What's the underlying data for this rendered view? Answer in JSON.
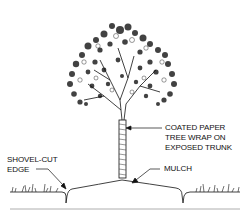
{
  "diagram": {
    "labels": {
      "tree_wrap": {
        "lines": [
          "COATED PAPER",
          "TREE WRAP ON",
          "EXPOSED TRUNK"
        ]
      },
      "shovel_cut_edge": {
        "lines": [
          "SHOVEL-CUT",
          "EDGE"
        ]
      },
      "mulch": {
        "lines": [
          "MULCH"
        ]
      }
    },
    "colors": {
      "ink": "#111111",
      "baseline": "#9a9a9a",
      "background": "#ffffff"
    }
  }
}
